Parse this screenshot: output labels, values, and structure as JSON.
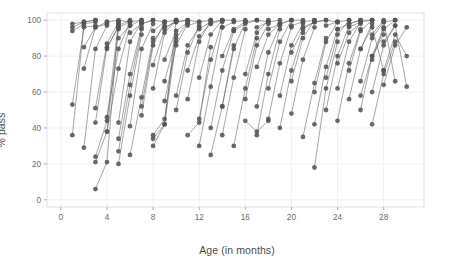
{
  "chart_data": {
    "type": "line",
    "title": "",
    "subtitle": "",
    "xlabel": "Age (in months)",
    "ylabel": "% pass",
    "xlim": [
      -1.2,
      31.5
    ],
    "ylim": [
      -4,
      104
    ],
    "xticks": [
      0,
      4,
      8,
      12,
      16,
      20,
      24,
      28
    ],
    "yticks": [
      0,
      20,
      40,
      60,
      80,
      100
    ],
    "xtick_labels": [
      "0",
      "4",
      "8",
      "12",
      "16",
      "20",
      "24",
      "28"
    ],
    "ytick_labels": [
      "0",
      "20",
      "40",
      "60",
      "80",
      "100"
    ],
    "grid": true,
    "grid_color": "#ebebeb",
    "panel_background": "#ffffff",
    "panel_border_color": "#d9d9d9",
    "legend": "none",
    "marker": "circle",
    "marker_size": 2.4,
    "line_color": "#555555",
    "line_width": 0.62,
    "series": [
      {
        "name": "item-01",
        "x": [
          1,
          2,
          3
        ],
        "y": [
          53,
          96,
          97
        ]
      },
      {
        "name": "item-02",
        "x": [
          1,
          2,
          3
        ],
        "y": [
          96,
          99,
          100
        ]
      },
      {
        "name": "item-03",
        "x": [
          1,
          2,
          3
        ],
        "y": [
          94,
          98,
          99
        ]
      },
      {
        "name": "item-04",
        "x": [
          1,
          2,
          3
        ],
        "y": [
          98,
          99,
          100
        ]
      },
      {
        "name": "item-05",
        "x": [
          1,
          2
        ],
        "y": [
          36,
          97
        ]
      },
      {
        "name": "item-06",
        "x": [
          2,
          3,
          4
        ],
        "y": [
          29,
          84,
          97
        ]
      },
      {
        "name": "item-07",
        "x": [
          2,
          3,
          4
        ],
        "y": [
          73,
          96,
          99
        ]
      },
      {
        "name": "item-08",
        "x": [
          3,
          4,
          5
        ],
        "y": [
          24,
          44,
          99
        ]
      },
      {
        "name": "item-09",
        "x": [
          3,
          4,
          5
        ],
        "y": [
          6,
          21,
          98
        ]
      },
      {
        "name": "item-10",
        "x": [
          3,
          4,
          5
        ],
        "y": [
          21,
          38,
          95
        ]
      },
      {
        "name": "item-11",
        "x": [
          3,
          4,
          5
        ],
        "y": [
          51,
          87,
          99
        ]
      },
      {
        "name": "item-12",
        "x": [
          3,
          4,
          5
        ],
        "y": [
          43,
          85,
          96
        ]
      },
      {
        "name": "item-13",
        "x": [
          4,
          5,
          6
        ],
        "y": [
          46,
          84,
          99
        ]
      },
      {
        "name": "item-14",
        "x": [
          4,
          5,
          6
        ],
        "y": [
          38,
          73,
          97
        ]
      },
      {
        "name": "item-15",
        "x": [
          5,
          6,
          7
        ],
        "y": [
          20,
          58,
          92
        ]
      },
      {
        "name": "item-16",
        "x": [
          5,
          6,
          7
        ],
        "y": [
          27,
          64,
          95
        ]
      },
      {
        "name": "item-17",
        "x": [
          5,
          6,
          7
        ],
        "y": [
          34,
          70,
          96
        ]
      },
      {
        "name": "item-18",
        "x": [
          5,
          6,
          7
        ],
        "y": [
          43,
          88,
          99
        ]
      },
      {
        "name": "item-19",
        "x": [
          6,
          7,
          8
        ],
        "y": [
          41,
          84,
          98
        ]
      },
      {
        "name": "item-20",
        "x": [
          6,
          7,
          8
        ],
        "y": [
          25,
          57,
          90
        ]
      },
      {
        "name": "item-21",
        "x": [
          7,
          8,
          9
        ],
        "y": [
          47,
          86,
          99
        ]
      },
      {
        "name": "item-22",
        "x": [
          7,
          8,
          9
        ],
        "y": [
          52,
          88,
          97
        ]
      },
      {
        "name": "item-23",
        "x": [
          8,
          9,
          10
        ],
        "y": [
          30,
          42,
          100
        ]
      },
      {
        "name": "item-24",
        "x": [
          8,
          9,
          10
        ],
        "y": [
          34,
          42,
          88
        ]
      },
      {
        "name": "item-25",
        "x": [
          8,
          9,
          10
        ],
        "y": [
          36,
          45,
          92
        ]
      },
      {
        "name": "item-26",
        "x": [
          8,
          9,
          10
        ],
        "y": [
          62,
          93,
          100
        ]
      },
      {
        "name": "item-27",
        "x": [
          8,
          9,
          10
        ],
        "y": [
          75,
          95,
          100
        ]
      },
      {
        "name": "item-28",
        "x": [
          9,
          10,
          11
        ],
        "y": [
          55,
          86,
          98
        ]
      },
      {
        "name": "item-29",
        "x": [
          9,
          10,
          11
        ],
        "y": [
          66,
          90,
          99
        ]
      },
      {
        "name": "item-30",
        "x": [
          10,
          11,
          12
        ],
        "y": [
          50,
          82,
          97
        ]
      },
      {
        "name": "item-31",
        "x": [
          10,
          11,
          12
        ],
        "y": [
          58,
          86,
          96
        ]
      },
      {
        "name": "item-32",
        "x": [
          11,
          12,
          13
        ],
        "y": [
          36,
          43,
          85
        ]
      },
      {
        "name": "item-33",
        "x": [
          11,
          12,
          13
        ],
        "y": [
          56,
          88,
          100
        ]
      },
      {
        "name": "item-34",
        "x": [
          12,
          13,
          14
        ],
        "y": [
          30,
          63,
          96
        ]
      },
      {
        "name": "item-35",
        "x": [
          12,
          13,
          14
        ],
        "y": [
          45,
          78,
          99
        ]
      },
      {
        "name": "item-36",
        "x": [
          12,
          13,
          14
        ],
        "y": [
          68,
          92,
          100
        ]
      },
      {
        "name": "item-37",
        "x": [
          13,
          14,
          15
        ],
        "y": [
          25,
          52,
          86
        ]
      },
      {
        "name": "item-38",
        "x": [
          13,
          14,
          15
        ],
        "y": [
          40,
          72,
          94
        ]
      },
      {
        "name": "item-39",
        "x": [
          14,
          15,
          16
        ],
        "y": [
          36,
          68,
          95
        ]
      },
      {
        "name": "item-40",
        "x": [
          14,
          15,
          16
        ],
        "y": [
          52,
          84,
          99
        ]
      },
      {
        "name": "item-41",
        "x": [
          15,
          16,
          17
        ],
        "y": [
          30,
          62,
          90
        ]
      },
      {
        "name": "item-42",
        "x": [
          16,
          17,
          18
        ],
        "y": [
          44,
          38,
          44
        ]
      },
      {
        "name": "item-43",
        "x": [
          16,
          17,
          18
        ],
        "y": [
          56,
          86,
          98
        ]
      },
      {
        "name": "item-44",
        "x": [
          16,
          17,
          18
        ],
        "y": [
          70,
          93,
          100
        ]
      },
      {
        "name": "item-45",
        "x": [
          17,
          18,
          19
        ],
        "y": [
          36,
          70,
          95
        ]
      },
      {
        "name": "item-46",
        "x": [
          17,
          18,
          19
        ],
        "y": [
          52,
          82,
          97
        ]
      },
      {
        "name": "item-47",
        "x": [
          18,
          19,
          20
        ],
        "y": [
          45,
          76,
          96
        ]
      },
      {
        "name": "item-48",
        "x": [
          18,
          19,
          20
        ],
        "y": [
          62,
          88,
          100
        ]
      },
      {
        "name": "item-49",
        "x": [
          19,
          20,
          21
        ],
        "y": [
          40,
          72,
          93
        ]
      },
      {
        "name": "item-50",
        "x": [
          19,
          20,
          21
        ],
        "y": [
          58,
          86,
          98
        ]
      },
      {
        "name": "item-51",
        "x": [
          20,
          21,
          22
        ],
        "y": [
          48,
          78,
          96
        ]
      },
      {
        "name": "item-52",
        "x": [
          20,
          21,
          22
        ],
        "y": [
          66,
          90,
          100
        ]
      },
      {
        "name": "item-53",
        "x": [
          21,
          22,
          23
        ],
        "y": [
          35,
          65,
          90
        ]
      },
      {
        "name": "item-54",
        "x": [
          22,
          23,
          24
        ],
        "y": [
          18,
          62,
          88
        ]
      },
      {
        "name": "item-55",
        "x": [
          22,
          23,
          24
        ],
        "y": [
          42,
          74,
          95
        ]
      },
      {
        "name": "item-56",
        "x": [
          22,
          23,
          24
        ],
        "y": [
          60,
          88,
          99
        ]
      },
      {
        "name": "item-57",
        "x": [
          23,
          24,
          25
        ],
        "y": [
          50,
          80,
          97
        ]
      },
      {
        "name": "item-58",
        "x": [
          23,
          24,
          25
        ],
        "y": [
          68,
          92,
          100
        ]
      },
      {
        "name": "item-59",
        "x": [
          24,
          25,
          26
        ],
        "y": [
          44,
          76,
          95
        ]
      },
      {
        "name": "item-60",
        "x": [
          24,
          25,
          26
        ],
        "y": [
          62,
          88,
          99
        ]
      },
      {
        "name": "item-61",
        "x": [
          25,
          26,
          27
        ],
        "y": [
          56,
          84,
          98
        ]
      },
      {
        "name": "item-62",
        "x": [
          25,
          26,
          27
        ],
        "y": [
          72,
          94,
          100
        ]
      },
      {
        "name": "item-63",
        "x": [
          26,
          27,
          28
        ],
        "y": [
          50,
          80,
          96
        ]
      },
      {
        "name": "item-64",
        "x": [
          26,
          27,
          28
        ],
        "y": [
          66,
          90,
          99
        ]
      },
      {
        "name": "item-65",
        "x": [
          27,
          28,
          29
        ],
        "y": [
          60,
          86,
          97
        ]
      },
      {
        "name": "item-66",
        "x": [
          27,
          28,
          29
        ],
        "y": [
          78,
          95,
          100
        ]
      },
      {
        "name": "item-67",
        "x": [
          28,
          29,
          30
        ],
        "y": [
          72,
          92,
          80
        ]
      },
      {
        "name": "item-68",
        "x": [
          28,
          29,
          30
        ],
        "y": [
          88,
          97,
          63
        ]
      },
      {
        "name": "item-69",
        "x": [
          27,
          28,
          29
        ],
        "y": [
          92,
          100,
          66
        ]
      },
      {
        "name": "item-70",
        "x": [
          26,
          27,
          28
        ],
        "y": [
          84,
          96,
          72
        ]
      },
      {
        "name": "item-71",
        "x": [
          4,
          5,
          6
        ],
        "y": [
          84,
          97,
          100
        ]
      },
      {
        "name": "item-72",
        "x": [
          5,
          6,
          7
        ],
        "y": [
          96,
          99,
          100
        ]
      },
      {
        "name": "item-73",
        "x": [
          5,
          6,
          7
        ],
        "y": [
          90,
          97,
          100
        ]
      },
      {
        "name": "item-74",
        "x": [
          6,
          7,
          8
        ],
        "y": [
          93,
          98,
          100
        ]
      },
      {
        "name": "item-75",
        "x": [
          8,
          9,
          10
        ],
        "y": [
          94,
          99,
          100
        ]
      },
      {
        "name": "item-76",
        "x": [
          9,
          10,
          11
        ],
        "y": [
          96,
          99,
          100
        ]
      },
      {
        "name": "item-77",
        "x": [
          11,
          12,
          13
        ],
        "y": [
          97,
          99,
          100
        ]
      },
      {
        "name": "item-78",
        "x": [
          12,
          13,
          14
        ],
        "y": [
          95,
          99,
          100
        ]
      },
      {
        "name": "item-79",
        "x": [
          14,
          15,
          16
        ],
        "y": [
          96,
          99,
          100
        ]
      },
      {
        "name": "item-80",
        "x": [
          15,
          16,
          17
        ],
        "y": [
          94,
          98,
          100
        ]
      },
      {
        "name": "item-81",
        "x": [
          17,
          18,
          19
        ],
        "y": [
          96,
          99,
          100
        ]
      },
      {
        "name": "item-82",
        "x": [
          18,
          19,
          20
        ],
        "y": [
          95,
          98,
          100
        ]
      },
      {
        "name": "item-83",
        "x": [
          20,
          21,
          22
        ],
        "y": [
          97,
          99,
          100
        ]
      },
      {
        "name": "item-84",
        "x": [
          21,
          22,
          23
        ],
        "y": [
          96,
          99,
          100
        ]
      },
      {
        "name": "item-85",
        "x": [
          23,
          24,
          25
        ],
        "y": [
          97,
          99,
          100
        ]
      },
      {
        "name": "item-86",
        "x": [
          24,
          25,
          26
        ],
        "y": [
          95,
          98,
          100
        ]
      },
      {
        "name": "item-87",
        "x": [
          25,
          26,
          27
        ],
        "y": [
          96,
          99,
          100
        ]
      },
      {
        "name": "item-88",
        "x": [
          4,
          5,
          6
        ],
        "y": [
          99,
          100,
          99
        ]
      },
      {
        "name": "item-89",
        "x": [
          7,
          8,
          9
        ],
        "y": [
          98,
          100,
          99
        ]
      },
      {
        "name": "item-90",
        "x": [
          10,
          11,
          12
        ],
        "y": [
          99,
          100,
          99
        ]
      },
      {
        "name": "item-91",
        "x": [
          13,
          14,
          15
        ],
        "y": [
          98,
          100,
          100
        ]
      },
      {
        "name": "item-92",
        "x": [
          16,
          17,
          18
        ],
        "y": [
          99,
          100,
          99
        ]
      },
      {
        "name": "item-93",
        "x": [
          19,
          20,
          21
        ],
        "y": [
          98,
          100,
          100
        ]
      },
      {
        "name": "item-94",
        "x": [
          22,
          23,
          24
        ],
        "y": [
          99,
          100,
          99
        ]
      },
      {
        "name": "item-95",
        "x": [
          25,
          26,
          27
        ],
        "y": [
          98,
          100,
          100
        ]
      },
      {
        "name": "item-96",
        "x": [
          28,
          29
        ],
        "y": [
          99,
          100
        ]
      },
      {
        "name": "item-97",
        "x": [
          2,
          3,
          4
        ],
        "y": [
          85,
          96,
          98
        ]
      },
      {
        "name": "item-98",
        "x": [
          9,
          10,
          11
        ],
        "y": [
          78,
          94,
          99
        ]
      },
      {
        "name": "item-99",
        "x": [
          11,
          12,
          13
        ],
        "y": [
          72,
          91,
          98
        ]
      },
      {
        "name": "item-100",
        "x": [
          14,
          15,
          16
        ],
        "y": [
          80,
          95,
          99
        ]
      },
      {
        "name": "item-101",
        "x": [
          17,
          18,
          19
        ],
        "y": [
          74,
          92,
          98
        ]
      },
      {
        "name": "item-102",
        "x": [
          20,
          21,
          22
        ],
        "y": [
          82,
          95,
          99
        ]
      },
      {
        "name": "item-103",
        "x": [
          24,
          25,
          26
        ],
        "y": [
          76,
          93,
          98
        ]
      },
      {
        "name": "item-104",
        "x": [
          26,
          27,
          28
        ],
        "y": [
          58,
          80,
          92
        ]
      },
      {
        "name": "item-105",
        "x": [
          27,
          28,
          29
        ],
        "y": [
          42,
          70,
          88
        ]
      },
      {
        "name": "item-106",
        "x": [
          28,
          29,
          30
        ],
        "y": [
          64,
          86,
          96
        ]
      }
    ]
  }
}
